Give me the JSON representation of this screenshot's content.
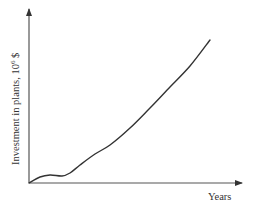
{
  "chart_data": {
    "type": "line",
    "title": "",
    "xlabel": "Years",
    "ylabel": "Investment in plants, 10⁶ $",
    "ylabel_parts": {
      "main": "Investment in plants, 10",
      "sup": "6",
      "unit": " $"
    },
    "x_ticks": [],
    "y_ticks": [],
    "grid": false,
    "legend": null,
    "series": [
      {
        "name": "Investment",
        "color": "#333333",
        "points_px": [
          [
            29,
            183
          ],
          [
            40,
            177
          ],
          [
            50,
            175
          ],
          [
            62,
            176
          ],
          [
            70,
            173
          ],
          [
            80,
            165
          ],
          [
            95,
            154
          ],
          [
            110,
            145
          ],
          [
            130,
            128
          ],
          [
            150,
            108
          ],
          [
            170,
            87
          ],
          [
            190,
            66
          ],
          [
            210,
            40
          ]
        ],
        "description": "Starts at zero, brief early rise, plateau, then steady nearly linear growth"
      }
    ]
  },
  "axes": {
    "color": "#555555",
    "origin": [
      29,
      183
    ],
    "x_end": [
      243,
      183
    ],
    "y_end": [
      29,
      8
    ]
  }
}
